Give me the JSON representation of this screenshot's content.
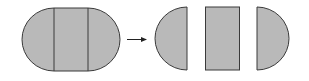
{
  "diagram": {
    "colors": {
      "fill": "#b9b9b9",
      "stroke": "#3a3a3a",
      "arrow": "#222222",
      "background": "#ffffff"
    },
    "source_shape": {
      "type": "stadium",
      "segments": [
        "left-semicircle",
        "rectangle",
        "right-semicircle"
      ]
    },
    "arrow": {
      "direction": "right"
    },
    "result_pieces": [
      "left-semicircle",
      "rectangle",
      "right-semicircle"
    ]
  }
}
